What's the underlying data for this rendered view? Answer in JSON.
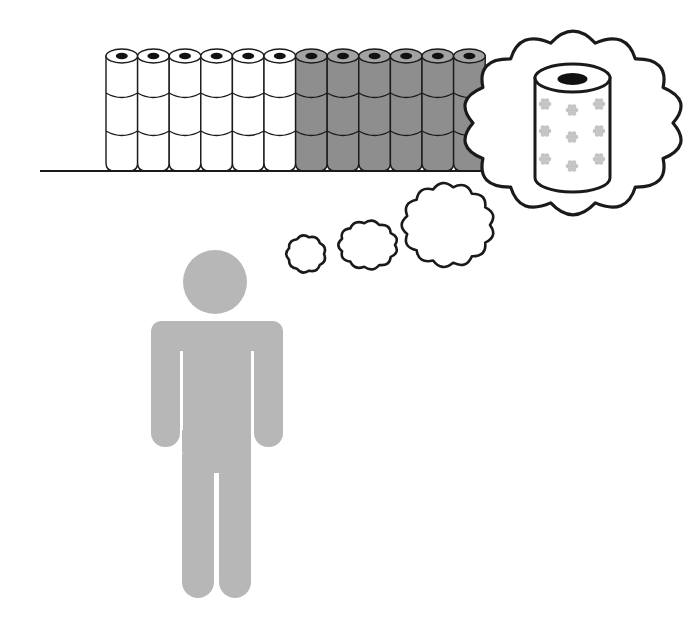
{
  "illustration": {
    "title": "Person dreaming of a patterned toilet paper roll",
    "colors": {
      "background": "#ffffff",
      "outline": "#1a1a1a",
      "roll_white": "#ffffff",
      "roll_gray": "#8e8e8e",
      "roll_gray_top": "#a2a2a2",
      "hole": "#111111",
      "person": "#b7b7b7",
      "flower": "#c4c4c4"
    },
    "shelf": {
      "floor_y": 171,
      "floor_x_start": 40,
      "floor_x_end": 486,
      "roll_columns": 12,
      "roll_rows": 3,
      "white_columns": 6,
      "gray_columns": 6,
      "first_roll_x": 106,
      "roll_width": 31.6,
      "top_y": 56,
      "row_lines_y": [
        96,
        134
      ]
    },
    "thought_bubbles": [
      {
        "name": "small",
        "cx": 306,
        "cy": 254,
        "rx": 18,
        "ry": 17
      },
      {
        "name": "medium",
        "cx": 368,
        "cy": 245,
        "rx": 27,
        "ry": 22
      },
      {
        "name": "large",
        "cx": 448,
        "cy": 225,
        "rx": 42,
        "ry": 38
      },
      {
        "name": "dream",
        "cx": 573,
        "cy": 123,
        "rx": 100,
        "ry": 82
      }
    ],
    "dream_roll": {
      "x": 535,
      "width": 75,
      "top_cy": 78,
      "bottom_cy": 178,
      "ry": 14,
      "hole_rx": 15,
      "hole_ry": 6,
      "flowers": [
        [
          545,
          104
        ],
        [
          572,
          110
        ],
        [
          599,
          104
        ],
        [
          545,
          131
        ],
        [
          572,
          137
        ],
        [
          599,
          131
        ],
        [
          545,
          159
        ],
        [
          572,
          166
        ],
        [
          599,
          159
        ]
      ]
    },
    "person": {
      "head_cx": 215,
      "head_cy": 282,
      "head_r": 32,
      "body_left": 151,
      "body_right": 283,
      "body_top": 321,
      "arm_bottom": 447,
      "leg_bottom": 598
    }
  }
}
